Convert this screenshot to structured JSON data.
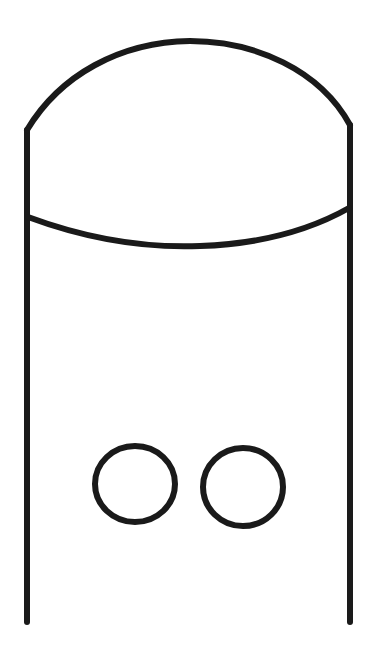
{
  "drawing": {
    "description": "Line drawing of a tall rounded-top container (dome cap with a curved band) with two small circles near the bottom",
    "stroke_color": "#1a1a1a",
    "background_color": "#ffffff",
    "stroke_width": 6,
    "shapes": {
      "left_wall": {
        "x1": 27,
        "y1": 130,
        "x2": 27,
        "y2": 622
      },
      "right_wall": {
        "x1": 350,
        "y1": 125,
        "x2": 350,
        "y2": 622
      },
      "dome": {
        "d": "M27,130 C60,75 120,42 190,41 C255,41 320,70 350,125"
      },
      "band_curve": {
        "d": "M28,217 C90,240 150,248 200,246 C260,244 310,230 349,208"
      },
      "circle_left": {
        "cx": 135,
        "cy": 484,
        "rx": 40,
        "ry": 38
      },
      "circle_right": {
        "cx": 243,
        "cy": 487,
        "rx": 40,
        "ry": 39
      }
    }
  }
}
